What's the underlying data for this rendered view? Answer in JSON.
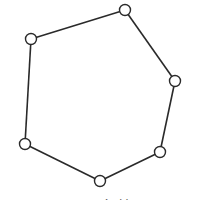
{
  "diagram": {
    "type": "cycle-graph",
    "stroke_color": "#2a2a2a",
    "node_fill": "#ffffff",
    "node_radius": 5.5,
    "nodes": [
      {
        "id": "n1",
        "x": 31,
        "y": 39
      },
      {
        "id": "n2",
        "x": 125,
        "y": 10
      },
      {
        "id": "n3",
        "x": 175,
        "y": 81
      },
      {
        "id": "n4",
        "x": 160,
        "y": 152
      },
      {
        "id": "n5",
        "x": 100,
        "y": 181
      },
      {
        "id": "n6",
        "x": 25,
        "y": 144
      }
    ],
    "edges": [
      [
        "n1",
        "n2"
      ],
      [
        "n2",
        "n3"
      ],
      [
        "n3",
        "n4"
      ],
      [
        "n4",
        "n5"
      ],
      [
        "n5",
        "n6"
      ],
      [
        "n6",
        "n1"
      ]
    ]
  },
  "caption": {
    "text": "图 — —  无向简图",
    "clipped": true
  }
}
